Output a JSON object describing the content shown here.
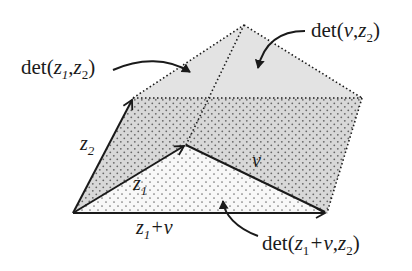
{
  "diagram": {
    "vectors": {
      "z1": {
        "label_base": "z",
        "label_sub": "1"
      },
      "z2": {
        "label_base": "z",
        "label_sub": "2"
      },
      "v": {
        "label": "v"
      },
      "z1_plus_v": {
        "base1": "z",
        "sub1": "1",
        "rest": "+v"
      }
    },
    "regions": {
      "det_z1_z2": {
        "prefix": "det(",
        "a": "z",
        "a_sub": "1",
        "comma": ",",
        "b": "z",
        "b_sub": "2",
        "suffix": ")"
      },
      "det_v_z2": {
        "prefix": "det(",
        "a": "v",
        "comma": ",",
        "b": "z",
        "b_sub": "2",
        "suffix": ")"
      },
      "det_z1v_z2": {
        "prefix": "det(",
        "a": "z",
        "a_sub": "1",
        "plus": "+v",
        "comma": ",",
        "b": "z",
        "b_sub": "2",
        "suffix": ")"
      }
    },
    "colors": {
      "light_fill": "#e4e4e4",
      "dotted_fill_bg": "#d6d6d6",
      "sparse_fill_bg": "#f7f7f7",
      "stroke": "#1a1a1a",
      "dot": "#6a6a6a"
    },
    "points": {
      "origin": [
        73,
        213
      ],
      "z2_tip": [
        133,
        98
      ],
      "z1_tip": [
        186,
        145
      ],
      "z1v_tip": [
        327,
        213
      ],
      "top": [
        244,
        25
      ],
      "right": [
        362,
        98
      ]
    }
  }
}
